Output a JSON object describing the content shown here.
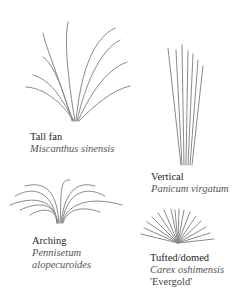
{
  "figure": {
    "stroke_color": "#8a8a8a",
    "forms": [
      {
        "id": "tall-fan",
        "common": "Tall fan",
        "scientific": [
          "Miscanthus sinensis"
        ],
        "cultivar": ""
      },
      {
        "id": "vertical",
        "common": "Vertical",
        "scientific": [
          "Panicum virgatum"
        ],
        "cultivar": ""
      },
      {
        "id": "arching",
        "common": "Arching",
        "scientific": [
          "Pennisetum",
          "alopecuroides"
        ],
        "cultivar": ""
      },
      {
        "id": "tufted-domed",
        "common": "Tufted/domed",
        "scientific": [
          "Carex oshimensis"
        ],
        "cultivar": "'Evergold'"
      }
    ]
  }
}
